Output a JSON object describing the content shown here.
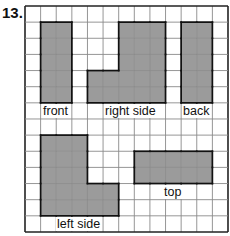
{
  "problem_number": "13.",
  "grid": {
    "cols": 13,
    "rows": 14,
    "left": 25,
    "top": 6,
    "cell_w": 15.615,
    "cell_h": 16.14
  },
  "colors": {
    "fill": "#9b9b9b",
    "grid_line": "#8a8a8a",
    "outline": "#111111"
  },
  "views": [
    {
      "name": "front",
      "label": "front",
      "cells": [
        [
          1,
          1
        ],
        [
          2,
          1
        ],
        [
          1,
          2
        ],
        [
          2,
          2
        ],
        [
          1,
          3
        ],
        [
          2,
          3
        ],
        [
          1,
          4
        ],
        [
          2,
          4
        ],
        [
          1,
          5
        ],
        [
          2,
          5
        ]
      ],
      "label_pos": [
        42,
        104
      ]
    },
    {
      "name": "right-side",
      "label": "right side",
      "cells": [
        [
          6,
          1
        ],
        [
          7,
          1
        ],
        [
          8,
          1
        ],
        [
          6,
          2
        ],
        [
          7,
          2
        ],
        [
          8,
          2
        ],
        [
          6,
          3
        ],
        [
          7,
          3
        ],
        [
          8,
          3
        ],
        [
          4,
          4
        ],
        [
          5,
          4
        ],
        [
          6,
          4
        ],
        [
          7,
          4
        ],
        [
          8,
          4
        ],
        [
          4,
          5
        ],
        [
          5,
          5
        ],
        [
          6,
          5
        ],
        [
          7,
          5
        ],
        [
          8,
          5
        ]
      ],
      "label_pos": [
        104,
        104
      ]
    },
    {
      "name": "back",
      "label": "back",
      "cells": [
        [
          10,
          1
        ],
        [
          11,
          1
        ],
        [
          10,
          2
        ],
        [
          11,
          2
        ],
        [
          10,
          3
        ],
        [
          11,
          3
        ],
        [
          10,
          4
        ],
        [
          11,
          4
        ],
        [
          10,
          5
        ],
        [
          11,
          5
        ]
      ],
      "label_pos": [
        182,
        104
      ]
    },
    {
      "name": "left-side",
      "label": "left side",
      "cells": [
        [
          1,
          8
        ],
        [
          2,
          8
        ],
        [
          3,
          8
        ],
        [
          1,
          9
        ],
        [
          2,
          9
        ],
        [
          3,
          9
        ],
        [
          1,
          10
        ],
        [
          2,
          10
        ],
        [
          3,
          10
        ],
        [
          1,
          11
        ],
        [
          2,
          11
        ],
        [
          3,
          11
        ],
        [
          4,
          11
        ],
        [
          5,
          11
        ],
        [
          1,
          12
        ],
        [
          2,
          12
        ],
        [
          3,
          12
        ],
        [
          4,
          12
        ],
        [
          5,
          12
        ]
      ],
      "label_pos": [
        56,
        217
      ]
    },
    {
      "name": "top",
      "label": "top",
      "cells": [
        [
          7,
          9
        ],
        [
          8,
          9
        ],
        [
          9,
          9
        ],
        [
          10,
          9
        ],
        [
          11,
          9
        ],
        [
          7,
          10
        ],
        [
          8,
          10
        ],
        [
          9,
          10
        ],
        [
          10,
          10
        ],
        [
          11,
          10
        ]
      ],
      "label_pos": [
        163,
        185
      ]
    }
  ]
}
